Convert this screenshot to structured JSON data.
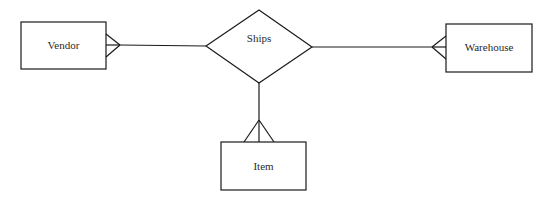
{
  "diagram": {
    "type": "er-diagram",
    "relationship": {
      "label": "Ships"
    },
    "entities": [
      {
        "id": "vendor",
        "label": "Vendor",
        "cardinality": "many"
      },
      {
        "id": "warehouse",
        "label": "Warehouse",
        "cardinality": "many"
      },
      {
        "id": "item",
        "label": "Item",
        "cardinality": "many"
      }
    ],
    "colors": {
      "stroke": "#1a1a1a",
      "background": "#ffffff",
      "text": "#2a2a2a"
    }
  }
}
